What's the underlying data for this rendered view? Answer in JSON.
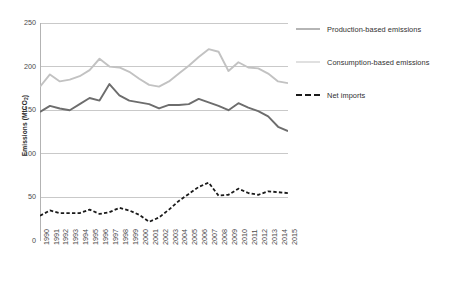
{
  "chart_data": {
    "type": "line",
    "title": "",
    "xlabel": "",
    "ylabel": "Emissions (MtCO2)",
    "ylabel_base": "Emissions (MtCO",
    "ylabel_sub": "2",
    "ylabel_tail": ")",
    "xlim": [
      1990,
      2015
    ],
    "ylim": [
      0,
      250
    ],
    "yticks": [
      0,
      50,
      100,
      150,
      200,
      250
    ],
    "ytick_labels": [
      "0",
      "50",
      "100",
      "150",
      "200",
      "250"
    ],
    "grid": "horizontal",
    "legend_position": "right",
    "categories": [
      1990,
      1991,
      1992,
      1993,
      1994,
      1995,
      1996,
      1997,
      1998,
      1999,
      2000,
      2001,
      2002,
      2003,
      2004,
      2005,
      2006,
      2007,
      2008,
      2009,
      2010,
      2011,
      2012,
      2013,
      2014,
      2015
    ],
    "xtick_labels": [
      "1990",
      "1991",
      "1992",
      "1993",
      "1994",
      "1995",
      "1996",
      "1997",
      "1998",
      "1999",
      "2000",
      "2001",
      "2002",
      "2003",
      "2004",
      "2005",
      "2006",
      "2007",
      "2008",
      "2009",
      "2010",
      "2011",
      "2012",
      "2013",
      "2014",
      "2015"
    ],
    "series": [
      {
        "name": "Production-based emissions",
        "color": "#6d6d6d",
        "style": "solid",
        "width": 1.9,
        "values": [
          148,
          155,
          152,
          150,
          157,
          164,
          161,
          180,
          167,
          161,
          159,
          157,
          152,
          156,
          156,
          157,
          163,
          159,
          155,
          150,
          158,
          153,
          149,
          143,
          131,
          126
        ]
      },
      {
        "name": "Consumption-based emissions",
        "color": "#c2c2c2",
        "style": "solid",
        "width": 1.9,
        "values": [
          177,
          191,
          183,
          185,
          189,
          196,
          209,
          200,
          199,
          194,
          186,
          179,
          177,
          183,
          192,
          201,
          211,
          220,
          217,
          195,
          205,
          199,
          198,
          192,
          183,
          181
        ]
      },
      {
        "name": "Net imports",
        "color": "#1a1a1a",
        "style": "dashed",
        "width": 1.8,
        "values": [
          29,
          35,
          32,
          32,
          32,
          36,
          31,
          33,
          38,
          35,
          30,
          22,
          27,
          36,
          46,
          54,
          62,
          67,
          52,
          53,
          60,
          55,
          53,
          57,
          56,
          55
        ]
      }
    ]
  },
  "legend": {
    "items": [
      {
        "label": "Production-based emissions",
        "color": "#6d6d6d",
        "style": "solid"
      },
      {
        "label": "Consumption-based emissions",
        "color": "#c2c2c2",
        "style": "solid"
      },
      {
        "label": "Net imports",
        "color": "#1a1a1a",
        "style": "dashed"
      }
    ]
  }
}
